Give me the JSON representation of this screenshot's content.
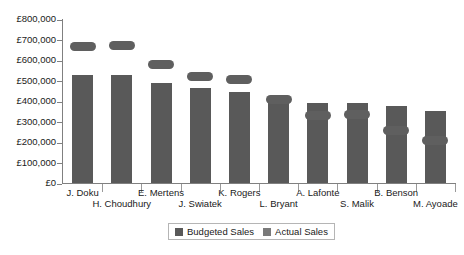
{
  "chart_data": {
    "type": "bar",
    "title": "",
    "xlabel": "",
    "ylabel": "",
    "categories": [
      "J. Doku",
      "H. Choudhury",
      "E. Mertens",
      "J. Swiatek",
      "K. Rogers",
      "L. Bryant",
      "A. Lafonte",
      "S. Malik",
      "B. Benson",
      "M. Ayoade"
    ],
    "series": [
      {
        "name": "Budgeted Sales",
        "color": "#595959",
        "values": [
          530000,
          530000,
          490000,
          465000,
          445000,
          415000,
          395000,
          395000,
          380000,
          355000
        ]
      },
      {
        "name": "Actual Sales",
        "color": "#5f5f5f",
        "values": [
          670000,
          675000,
          580000,
          520000,
          505000,
          410000,
          330000,
          335000,
          260000,
          210000
        ]
      }
    ],
    "ylim": [
      0,
      800000
    ],
    "ytick_values": [
      0,
      100000,
      200000,
      300000,
      400000,
      500000,
      600000,
      700000,
      800000
    ],
    "ytick_labels": [
      "£0",
      "£100,000",
      "£200,000",
      "£300,000",
      "£400,000",
      "£500,000",
      "£600,000",
      "£700,000",
      "£800,000"
    ],
    "grid": false,
    "legend_position": "bottom"
  },
  "legend": {
    "items": [
      {
        "label": "Budgeted Sales",
        "color": "#595959"
      },
      {
        "label": "Actual Sales",
        "color": "#7a7a7a"
      }
    ]
  }
}
